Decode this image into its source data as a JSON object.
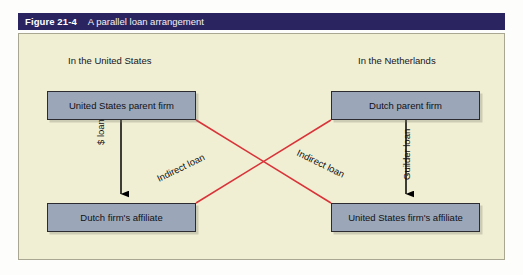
{
  "figure": {
    "number": "Figure 21-4",
    "caption": "A parallel loan arrangement",
    "title_bar_color": "#2a2560",
    "panel_color": "#f1efd3",
    "box_fill_color": "#9ba7b9",
    "box_border_color": "#2b2b31",
    "solid_arrow_color": "#000000",
    "diagonal_line_color": "#d8343a"
  },
  "regions": [
    {
      "id": "united-states",
      "label": "In the United States"
    },
    {
      "id": "netherlands",
      "label": "In the Netherlands"
    }
  ],
  "entities": [
    {
      "id": "us-parent",
      "label": "United States parent firm"
    },
    {
      "id": "nl-parent",
      "label": "Dutch parent firm"
    },
    {
      "id": "nl-affiliate",
      "label": "Dutch firm's affiliate"
    },
    {
      "id": "us-affiliate",
      "label": "United States firm's affiliate"
    }
  ],
  "connections": [
    {
      "id": "dollar-loan",
      "label": "$ loan",
      "from": "us-parent",
      "to": "nl-affiliate",
      "style": "solid-black-arrow",
      "orientation": "vertical"
    },
    {
      "id": "guilder-loan",
      "label": "Guilder loan",
      "from": "nl-parent",
      "to": "us-affiliate",
      "style": "solid-black-arrow",
      "orientation": "vertical"
    },
    {
      "id": "indirect-loan-left",
      "label": "Indirect loan",
      "from": "nl-parent",
      "to": "nl-affiliate",
      "style": "red-diagonal-line",
      "orientation": "diagonal"
    },
    {
      "id": "indirect-loan-right",
      "label": "Indirect loan",
      "from": "us-parent",
      "to": "us-affiliate",
      "style": "red-diagonal-line",
      "orientation": "diagonal"
    }
  ]
}
